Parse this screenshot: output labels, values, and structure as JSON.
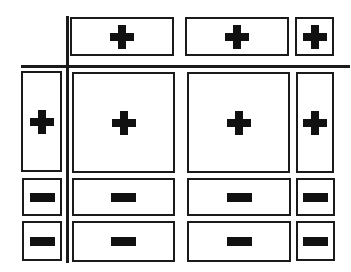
{
  "diagram": {
    "title": "",
    "grid": {
      "header_row": [
        "plus",
        "plus",
        "plus"
      ],
      "rows": [
        [
          "plus",
          "plus",
          "plus",
          "plus"
        ],
        [
          "minus",
          "minus",
          "minus",
          "minus"
        ],
        [
          "minus",
          "minus",
          "minus",
          "minus"
        ]
      ]
    },
    "colors": {
      "stroke": "#1a1a1a",
      "fill": "#111111",
      "background": "#ffffff"
    }
  }
}
